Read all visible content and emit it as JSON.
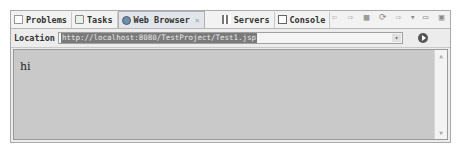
{
  "tabs": [
    {
      "label": "Problems",
      "icon": "problems-icon",
      "active": false
    },
    {
      "label": "Tasks",
      "icon": "tasks-icon",
      "active": false
    },
    {
      "label": "Web Browser",
      "icon": "web-browser-icon",
      "active": true,
      "close": "✕"
    },
    {
      "label": "Servers",
      "icon": "servers-icon",
      "active": false
    },
    {
      "label": "Console",
      "icon": "console-icon",
      "active": false
    }
  ],
  "toolbar": {
    "back": "⇦",
    "forward": "⇨",
    "stop": "▦",
    "refresh": "⟳",
    "more": "⇨",
    "menu": "▾",
    "minimize": "▭",
    "maximize": "▣"
  },
  "location": {
    "label": "Location",
    "url": "http://localhost:8080/TestProject/Test1.jsp",
    "dropdown": "▾"
  },
  "page": {
    "text": "hi"
  },
  "scrollbar": {
    "up": "▲",
    "down": "▼"
  }
}
